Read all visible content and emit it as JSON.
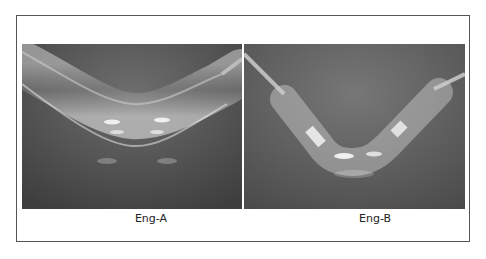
{
  "figure": {
    "panels": [
      {
        "id": "A",
        "caption": "Eng-A",
        "subject": "bent transparent tube, smooth U-shaped bend"
      },
      {
        "id": "B",
        "caption": "Eng-B",
        "subject": "bent transparent tube, V-shaped bend with segmented bright bands"
      }
    ],
    "colors": {
      "frame": "#555555",
      "background": "#ffffff",
      "photo_bg": "#5a5a5a"
    }
  }
}
